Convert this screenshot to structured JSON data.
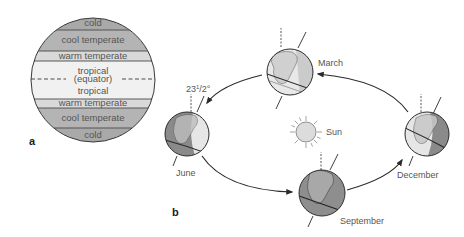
{
  "panel_a": {
    "label": "a",
    "bands": [
      {
        "id": "cold-north",
        "label": "cold",
        "color": "#a9a9a9"
      },
      {
        "id": "cool-temperate-north",
        "label": "cool temperate",
        "color": "#b4b4b4"
      },
      {
        "id": "warm-temperate-north",
        "label": "warm temperate",
        "color": "#d9d9d9"
      },
      {
        "id": "tropical-north",
        "label": "tropical",
        "color": "#f1f1f1"
      },
      {
        "id": "tropical-south",
        "label": "tropical",
        "color": "#f1f1f1"
      },
      {
        "id": "warm-temperate-south",
        "label": "warm temperate",
        "color": "#d9d9d9"
      },
      {
        "id": "cool-temperate-south",
        "label": "cool temperate",
        "color": "#b4b4b4"
      },
      {
        "id": "cold-south",
        "label": "cold",
        "color": "#a9a9a9"
      }
    ],
    "equator_label": "(equator)"
  },
  "panel_b": {
    "label": "b",
    "sun_label": "Sun",
    "tilt_label_main": "23",
    "tilt_label_num": "1",
    "tilt_label_frac": "/2°",
    "months": [
      {
        "id": "march",
        "label": "March",
        "shade": "light"
      },
      {
        "id": "june",
        "label": "June",
        "shade": "left-dark"
      },
      {
        "id": "september",
        "label": "September",
        "shade": "dark"
      },
      {
        "id": "december",
        "label": "December",
        "shade": "right-dark"
      }
    ],
    "orbit_direction": "counterclockwise (March → June → September → December → March)"
  },
  "colors": {
    "line": "#2a2a2a",
    "text": "#555555",
    "globe_light": "#e6e6e6",
    "globe_dark": "#8a8a8a",
    "sun_fill": "#dcdcdc"
  }
}
